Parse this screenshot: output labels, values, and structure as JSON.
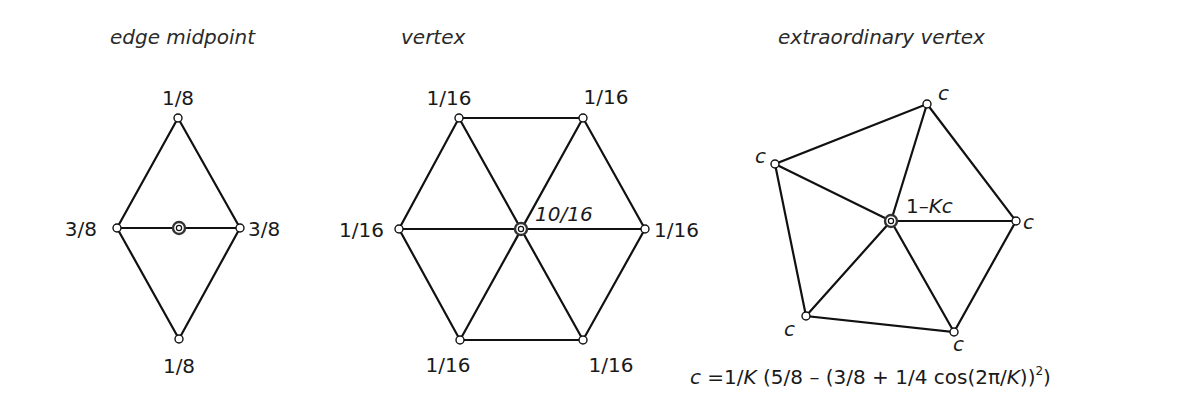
{
  "panels": [
    {
      "id": "edge-midpoint",
      "title": "edge midpoint",
      "labels": {
        "top": "1/8",
        "left": "3/8",
        "right": "3/8",
        "bottom": "1/8"
      }
    },
    {
      "id": "vertex",
      "title": "vertex",
      "labels": {
        "top_left": "1/16",
        "top_right": "1/16",
        "left": "1/16",
        "right": "1/16",
        "bottom_left": "1/16",
        "bottom_right": "1/16",
        "center": "10/16"
      }
    },
    {
      "id": "extraordinary-vertex",
      "title": "extraordinary vertex",
      "labels": {
        "top": "c",
        "left": "c",
        "right": "c",
        "bottom_left": "c",
        "bottom_right": "c",
        "center_prefix": "1–",
        "center_k": "Kc"
      },
      "formula": {
        "c": "c",
        "eq": " =1/",
        "K1": "K",
        "part1": " (5/8 – (3/8 + 1/4 cos(2π/",
        "K2": "K",
        "part2": "))",
        "sup": "2",
        "close": ")"
      }
    }
  ]
}
